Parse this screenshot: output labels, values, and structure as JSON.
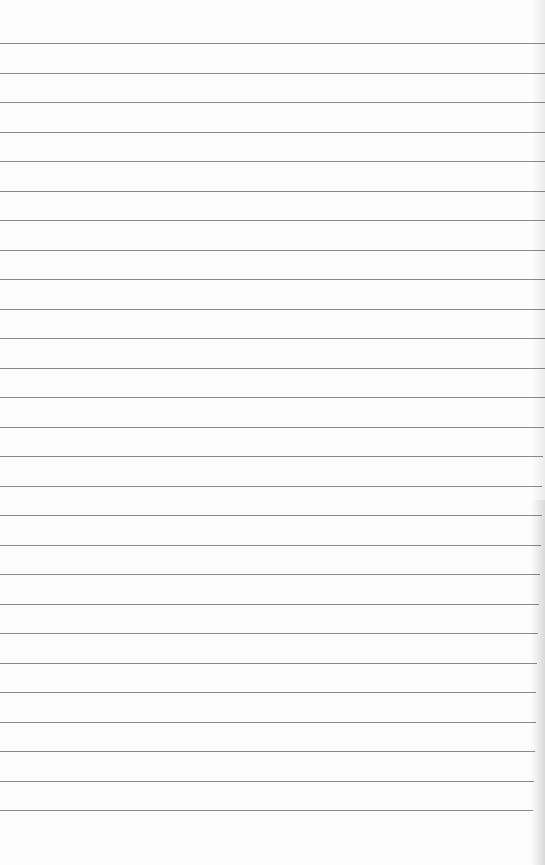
{
  "paper": {
    "type": "lined-paper",
    "line_count": 27,
    "line_color": "#8a8a8a",
    "background_color": "#fdfdfd"
  }
}
